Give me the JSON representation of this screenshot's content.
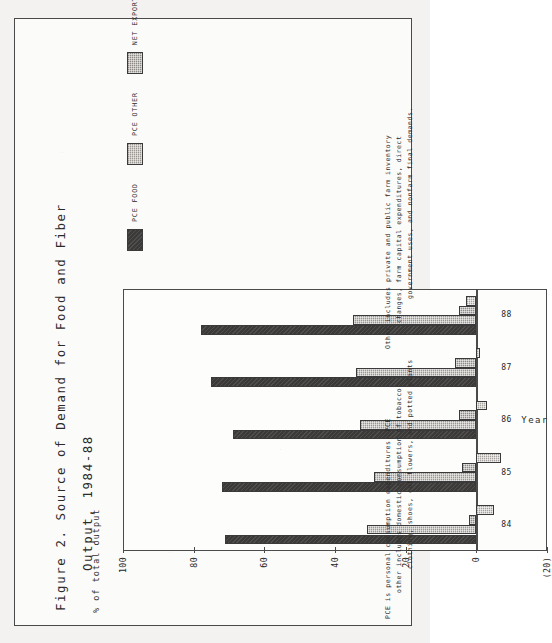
{
  "figure": {
    "title_line1": "Figure 2. Source of Demand for Food and Fiber",
    "title_line2": "Output, 1984-88",
    "value_axis_caption": "% of total output",
    "category_axis_title": "Year"
  },
  "legend": {
    "items": [
      {
        "label": "PCE FOOD",
        "fill": "fill-pce-food",
        "color": "#3c3a38"
      },
      {
        "label": "PCE OTHER",
        "fill": "fill-pce-other",
        "color": "#9a9691"
      },
      {
        "label": "NET EXPORTS",
        "fill": "fill-net-exports",
        "color": "#8d8a86"
      },
      {
        "label": "OTHER",
        "fill": "fill-other",
        "color": "#a5a29d"
      }
    ]
  },
  "footnotes": {
    "left": [
      "PCE is personal consumption expenditures.  PCE",
      "other includes domestic consumption of tobacco",
      "clothing, shoes, cut flowers, and potted plants"
    ],
    "right": [
      "Other includes private and public farm inventory",
      "changes, farm capital expenditures, direct",
      "government uses, and nonfarm final demands."
    ]
  },
  "chart_data": {
    "type": "bar",
    "title": "Figure 2. Source of Demand for Food and Fiber Output, 1984-88",
    "xlabel": "Year",
    "ylabel": "% of total output",
    "ylim": [
      -20,
      100
    ],
    "yticks": [
      100,
      80,
      60,
      40,
      20,
      0,
      -20
    ],
    "ytick_labels": [
      "100",
      "80",
      "60",
      "40",
      "20",
      "0",
      "(20)"
    ],
    "grid": false,
    "legend_position": "top-right",
    "stacked": false,
    "categories": [
      "84",
      "85",
      "86",
      "87",
      "88"
    ],
    "series": [
      {
        "name": "PCE FOOD",
        "values": [
          71,
          72,
          69,
          75,
          78
        ]
      },
      {
        "name": "PCE OTHER",
        "values": [
          31,
          29,
          33,
          34,
          35
        ]
      },
      {
        "name": "NET EXPORTS",
        "values": [
          2,
          4,
          5,
          6,
          5
        ]
      },
      {
        "name": "OTHER",
        "values": [
          -5,
          -7,
          -3,
          -1,
          3
        ]
      }
    ]
  }
}
